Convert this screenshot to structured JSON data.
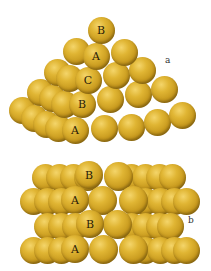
{
  "figure": {
    "panels": [
      {
        "id": "a",
        "label": "a",
        "description": "Tetrahedral stack of spheres showing ABC close packing",
        "layer_labels": [
          "B",
          "A",
          "C",
          "B",
          "A"
        ]
      },
      {
        "id": "b",
        "label": "b",
        "description": "Side view of layered spheres showing ABAB stacking",
        "layer_labels": [
          "B",
          "A",
          "B",
          "A"
        ]
      }
    ],
    "colors": {
      "sphere_highlight": "#f4d56a",
      "sphere_base": "#c89a1e",
      "sphere_shadow": "#6e520a",
      "label_text": "#2a2008",
      "background": "#ffffff"
    }
  }
}
